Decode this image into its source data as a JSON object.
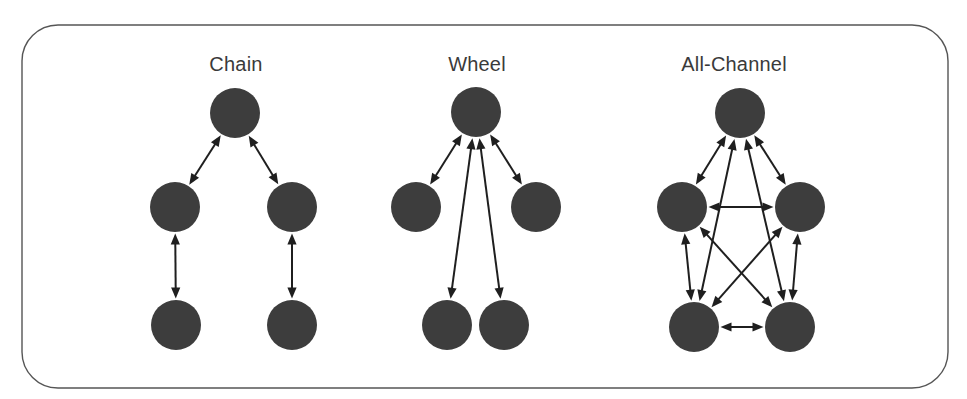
{
  "figure": {
    "type": "diagram",
    "frame": {
      "shape": "rounded-rectangle",
      "x": 22,
      "y": 25,
      "width": 926,
      "height": 363,
      "corner_radius": 36,
      "stroke_color": "#555555",
      "stroke_width": 1.4,
      "fill_color": "#ffffff"
    },
    "background_color": "#ffffff",
    "node_style": {
      "shape": "circle",
      "radius": 25,
      "fill_color": "#3d3d3d"
    },
    "edge_style": {
      "stroke_color": "#1f1f1f",
      "stroke_width": 2,
      "arrowheads": "both-ends",
      "arrowhead_shape": "solid-triangle"
    },
    "panels": [
      {
        "id": "chain",
        "label": "Chain",
        "label_x": 236,
        "label_y": 71,
        "nodes": [
          {
            "id": "c-top",
            "x": 235,
            "y": 113
          },
          {
            "id": "c-mid-l",
            "x": 175,
            "y": 207
          },
          {
            "id": "c-mid-r",
            "x": 292,
            "y": 207
          },
          {
            "id": "c-bot-l",
            "x": 176,
            "y": 325
          },
          {
            "id": "c-bot-r",
            "x": 292,
            "y": 325
          }
        ],
        "edges": [
          {
            "from": "c-top",
            "to": "c-mid-l"
          },
          {
            "from": "c-top",
            "to": "c-mid-r"
          },
          {
            "from": "c-mid-l",
            "to": "c-bot-l"
          },
          {
            "from": "c-mid-r",
            "to": "c-bot-r"
          }
        ],
        "edge_count": 4
      },
      {
        "id": "wheel",
        "label": "Wheel",
        "label_x": 477,
        "label_y": 71,
        "nodes": [
          {
            "id": "w-center",
            "x": 476,
            "y": 112
          },
          {
            "id": "w-left",
            "x": 416,
            "y": 207
          },
          {
            "id": "w-right",
            "x": 536,
            "y": 207
          },
          {
            "id": "w-bot-l",
            "x": 447,
            "y": 325
          },
          {
            "id": "w-bot-r",
            "x": 504,
            "y": 325
          }
        ],
        "edges": [
          {
            "from": "w-center",
            "to": "w-left"
          },
          {
            "from": "w-center",
            "to": "w-right"
          },
          {
            "from": "w-center",
            "to": "w-bot-l"
          },
          {
            "from": "w-center",
            "to": "w-bot-r"
          }
        ],
        "edge_count": 4
      },
      {
        "id": "all-channel",
        "label": "All-Channel",
        "label_x": 734,
        "label_y": 71,
        "nodes": [
          {
            "id": "a-top",
            "x": 740,
            "y": 113
          },
          {
            "id": "a-mid-l",
            "x": 682,
            "y": 207
          },
          {
            "id": "a-mid-r",
            "x": 800,
            "y": 207
          },
          {
            "id": "a-bot-l",
            "x": 694,
            "y": 327
          },
          {
            "id": "a-bot-r",
            "x": 790,
            "y": 327
          }
        ],
        "edges": [
          {
            "from": "a-top",
            "to": "a-mid-l"
          },
          {
            "from": "a-top",
            "to": "a-mid-r"
          },
          {
            "from": "a-top",
            "to": "a-bot-l"
          },
          {
            "from": "a-top",
            "to": "a-bot-r"
          },
          {
            "from": "a-mid-l",
            "to": "a-mid-r"
          },
          {
            "from": "a-mid-l",
            "to": "a-bot-l"
          },
          {
            "from": "a-mid-l",
            "to": "a-bot-r"
          },
          {
            "from": "a-mid-r",
            "to": "a-bot-l"
          },
          {
            "from": "a-mid-r",
            "to": "a-bot-r"
          },
          {
            "from": "a-bot-l",
            "to": "a-bot-r"
          }
        ],
        "edge_count": 10
      }
    ]
  }
}
